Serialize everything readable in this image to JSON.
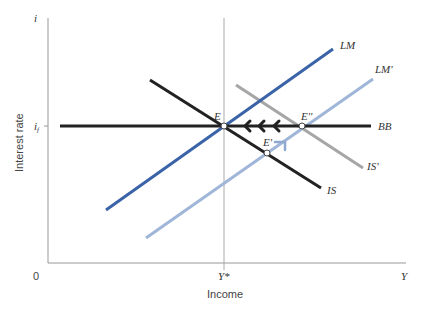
{
  "diagram": {
    "type": "IS-LM-BB diagram",
    "axes": {
      "x_label": "Income",
      "y_label": "Interest rate",
      "x_end": "Y",
      "y_end": "i",
      "origin": "0",
      "x_tick": "Y*",
      "y_tick": "i_f"
    },
    "curves": [
      {
        "name": "LM",
        "label": "LM",
        "color": "#3a63a8"
      },
      {
        "name": "LM'",
        "label": "LM'",
        "color": "#9fb6d8"
      },
      {
        "name": "IS",
        "label": "IS",
        "color": "#222222"
      },
      {
        "name": "IS'",
        "label": "IS'",
        "color": "#a6a6a6"
      },
      {
        "name": "BB",
        "label": "BB",
        "color": "#222222"
      }
    ],
    "points": [
      {
        "name": "E",
        "label": "E"
      },
      {
        "name": "E'",
        "label": "E'"
      },
      {
        "name": "E''",
        "label": "E''"
      }
    ],
    "arrows": {
      "along_bb": "three arrows pointing left from E'' to E",
      "lm_shift": "arrow pointing up-right along LM'"
    }
  }
}
